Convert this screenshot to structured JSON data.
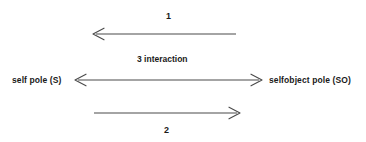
{
  "diagram": {
    "background_color": "#ffffff",
    "line_color": "#4a4a4a",
    "text_color": "#1a1a1a",
    "poles": {
      "left_label": "self pole (S)",
      "right_label": "selfobject pole (SO)"
    },
    "arrows": [
      {
        "id": "arrow-1",
        "label": "1",
        "direction": "right-to-left",
        "label_position": "above",
        "x_start": 236,
        "x_end": 93,
        "y": 34
      },
      {
        "id": "arrow-3",
        "label": "3  interaction",
        "direction": "bidirectional",
        "label_position": "above",
        "x_start": 75,
        "x_end": 262,
        "y": 80
      },
      {
        "id": "arrow-2",
        "label": "2",
        "direction": "left-to-right",
        "label_position": "below",
        "x_start": 94,
        "x_end": 240,
        "y": 113
      }
    ],
    "labels": {
      "top_number": "1",
      "middle_text": "3  interaction",
      "bottom_number": "2"
    }
  }
}
